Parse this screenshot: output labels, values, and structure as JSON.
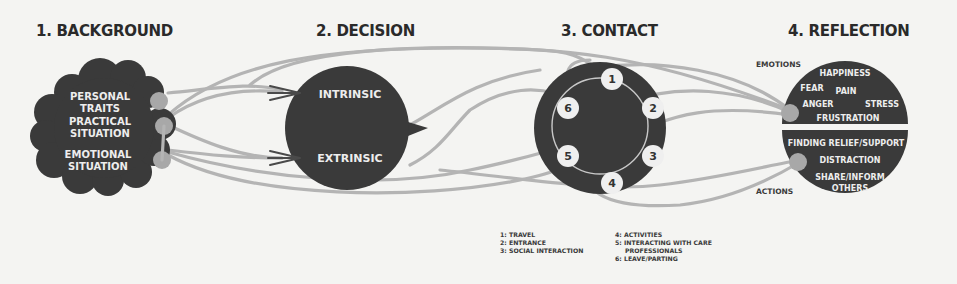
{
  "stages": {
    "background": {
      "title": "1. BACKGROUND",
      "items": [
        {
          "line1": "PERSONAL",
          "line2": "TRAITS"
        },
        {
          "line1": "PRACTICAL",
          "line2": "SITUATION"
        },
        {
          "line1": "EMOTIONAL",
          "line2": "SITUATION"
        }
      ]
    },
    "decision": {
      "title": "2. DECISION",
      "items": [
        "INTRINSIC",
        "EXTRINSIC"
      ]
    },
    "contact": {
      "title": "3. CONTACT",
      "nodes": [
        "1",
        "2",
        "3",
        "4",
        "5",
        "6"
      ],
      "legend": {
        "col1": [
          "1: TRAVEL",
          "2: ENTRANCE",
          "3: SOCIAL INTERACTION"
        ],
        "col2": [
          "4: ACTIVITIES",
          "5: INTERACTING WITH CARE",
          "PROFESSIONALS",
          "6: LEAVE/PARTING"
        ]
      }
    },
    "reflection": {
      "title": "4. REFLECTION",
      "emotions_label": "EMOTIONS",
      "actions_label": "ACTIONS",
      "emotions": [
        "HAPPINESS",
        "FEAR",
        "PAIN",
        "ANGER",
        "STRESS",
        "FRUSTRATION"
      ],
      "actions": [
        "FINDING RELIEF/SUPPORT",
        "DISTRACTION",
        "SHARE/INFORM",
        "OTHERS"
      ]
    }
  },
  "colors": {
    "dark_fill": "#3a3a3a",
    "path_gray": "#b4b4b4",
    "node_gray": "#a8a8a8",
    "node_white": "#efefef",
    "background": "#f4f4f2"
  }
}
